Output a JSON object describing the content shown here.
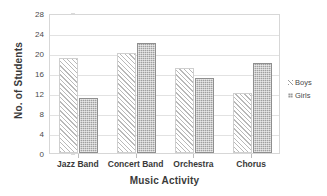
{
  "chart_data": {
    "type": "bar",
    "title": "",
    "xlabel": "Music Activity",
    "ylabel": "No. of Students",
    "categories": [
      "Jazz Band",
      "Concert Band",
      "Orchestra",
      "Chorus"
    ],
    "series": [
      {
        "name": "Boys",
        "values": [
          19,
          20,
          17,
          12
        ],
        "fill": "diagonal-hatch",
        "color": "#b9b9b9"
      },
      {
        "name": "Girls",
        "values": [
          11,
          22,
          15,
          18
        ],
        "fill": "stipple",
        "color": "#a0a0a0"
      }
    ],
    "ylim": [
      0,
      28
    ],
    "yticks": [
      0,
      4,
      8,
      12,
      16,
      20,
      24,
      28
    ],
    "ytick_labels": [
      "0",
      "4",
      "8",
      "12",
      "16",
      "20",
      "24",
      "28"
    ],
    "grid": true,
    "grid_axis": "y",
    "legend_position": "right",
    "legend": [
      "Boys",
      "Girls"
    ]
  }
}
